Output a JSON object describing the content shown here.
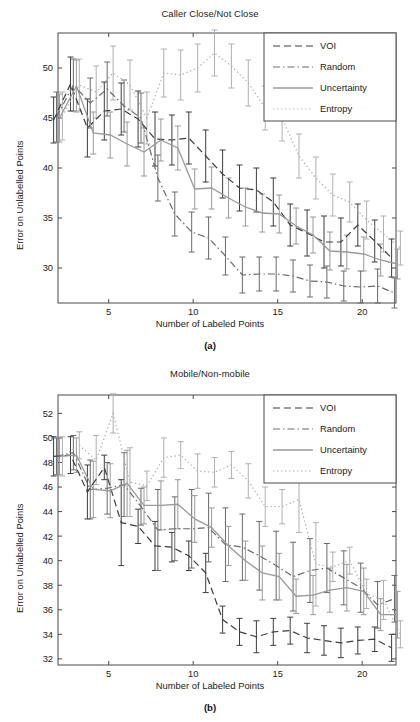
{
  "figure": {
    "axis_xlabel": "Number of Labeled Points",
    "axis_ylabel": "Error on Unlabelled Points",
    "panel_a_label": "(a)",
    "panel_b_label": "(b)"
  },
  "legend": {
    "entries": [
      {
        "label": "VOI",
        "style": "dashed",
        "color": "#3d3d3d"
      },
      {
        "label": "Random",
        "style": "dashdot",
        "color": "#6a6a6a"
      },
      {
        "label": "Uncertainty",
        "style": "solid",
        "color": "#9a9a9a"
      },
      {
        "label": "Entropy",
        "style": "dotted",
        "color": "#b0b0b0"
      }
    ]
  },
  "chart_data": [
    {
      "type": "line",
      "title": "Caller Close/Not Close",
      "xlabel": "Number of Labeled Points",
      "ylabel": "Error on Unlabelled Points",
      "panel": "(a)",
      "grid": false,
      "legend_position": "top-right",
      "xlim": [
        2,
        22
      ],
      "ylim": [
        26.5,
        53.5
      ],
      "xticks": [
        5,
        10,
        15,
        20
      ],
      "yticks": [
        30,
        35,
        40,
        45,
        50
      ],
      "x": [
        2,
        3,
        4,
        5,
        6,
        7,
        8,
        9,
        10,
        11,
        12,
        13,
        14,
        15,
        16,
        17,
        18,
        19,
        20,
        21,
        22
      ],
      "series": [
        {
          "name": "VOI",
          "style": "dashed",
          "color": "#3d3d3d",
          "values": [
            44.8,
            48.4,
            44.0,
            45.7,
            45.9,
            44.9,
            42.9,
            42.8,
            43.0,
            41.2,
            39.4,
            38.0,
            37.8,
            36.6,
            34.3,
            33.5,
            32.6,
            32.6,
            34.3,
            32.7,
            31.0
          ],
          "err": [
            2.3,
            2.7,
            2.9,
            2.9,
            2.6,
            2.8,
            2.7,
            2.5,
            2.6,
            2.6,
            2.4,
            2.3,
            2.2,
            2.4,
            2.1,
            2.3,
            2.6,
            2.4,
            2.1,
            2.1,
            1.9
          ]
        },
        {
          "name": "Random",
          "style": "dashdot",
          "color": "#6a6a6a",
          "values": [
            45.1,
            48.3,
            46.5,
            47.9,
            46.2,
            45.0,
            39.0,
            35.4,
            33.6,
            33.0,
            31.2,
            29.3,
            29.4,
            29.4,
            29.2,
            28.7,
            28.6,
            28.2,
            28.1,
            28.2,
            27.5
          ],
          "err": [
            2.5,
            2.6,
            2.5,
            2.7,
            2.6,
            2.5,
            2.3,
            2.2,
            2.0,
            2.1,
            1.9,
            1.8,
            1.7,
            1.7,
            1.6,
            1.6,
            1.6,
            1.5,
            1.6,
            1.7,
            1.5
          ]
        },
        {
          "name": "Uncertainty",
          "style": "solid",
          "color": "#9a9a9a",
          "values": [
            45.0,
            48.2,
            43.5,
            43.3,
            42.4,
            41.6,
            42.8,
            42.0,
            37.9,
            38.0,
            37.0,
            36.1,
            35.5,
            35.4,
            34.2,
            33.3,
            31.7,
            31.6,
            31.4,
            30.8,
            30.4
          ],
          "err": [
            2.4,
            2.6,
            2.1,
            2.3,
            2.2,
            2.4,
            2.1,
            2.2,
            2.0,
            2.1,
            2.0,
            1.9,
            1.9,
            1.9,
            1.8,
            1.8,
            1.9,
            1.7,
            1.7,
            1.6,
            1.5
          ]
        },
        {
          "name": "Entropy",
          "style": "dotted",
          "color": "#b0b0b0",
          "values": [
            45.2,
            48.3,
            47.6,
            49.5,
            48.3,
            45.0,
            49.5,
            49.3,
            50.0,
            51.5,
            50.2,
            48.5,
            46.0,
            45.0,
            41.2,
            39.0,
            37.3,
            36.6,
            34.8,
            33.4,
            32.0
          ],
          "err": [
            2.4,
            2.6,
            2.6,
            2.7,
            2.5,
            2.6,
            2.4,
            2.5,
            2.4,
            2.3,
            2.2,
            2.3,
            2.2,
            2.3,
            2.2,
            2.1,
            2.1,
            2.0,
            1.9,
            1.8,
            1.7
          ]
        }
      ]
    },
    {
      "type": "line",
      "title": "Mobile/Non-mobile",
      "xlabel": "Number of Labeled Points",
      "ylabel": "Error on Unlabelled Points",
      "panel": "(b)",
      "grid": false,
      "legend_position": "top-right",
      "xlim": [
        2,
        22
      ],
      "ylim": [
        31.5,
        53.5
      ],
      "xticks": [
        5,
        10,
        15,
        20
      ],
      "yticks": [
        32,
        34,
        36,
        38,
        40,
        42,
        44,
        46,
        48,
        50,
        52
      ],
      "x": [
        2,
        3,
        4,
        5,
        6,
        7,
        8,
        9,
        10,
        11,
        12,
        13,
        14,
        15,
        16,
        17,
        18,
        19,
        20,
        21,
        22
      ],
      "series": [
        {
          "name": "VOI",
          "style": "dashed",
          "color": "#3d3d3d",
          "values": [
            48.5,
            48.6,
            45.6,
            47.6,
            43.1,
            42.8,
            41.2,
            41.1,
            40.4,
            39.0,
            35.2,
            34.2,
            33.8,
            34.2,
            34.3,
            33.7,
            33.5,
            33.3,
            33.5,
            33.6,
            32.9
          ],
          "err": [
            1.6,
            1.5,
            2.2,
            1.0,
            3.5,
            1.4,
            2.0,
            1.2,
            1.2,
            1.6,
            1.1,
            1.1,
            1.3,
            1.1,
            1.1,
            1.2,
            1.2,
            1.2,
            1.1,
            1.0,
            1.1
          ]
        },
        {
          "name": "Random",
          "style": "dashdot",
          "color": "#6a6a6a",
          "values": [
            48.5,
            48.8,
            45.8,
            45.9,
            46.2,
            44.4,
            42.5,
            42.6,
            42.6,
            42.7,
            41.3,
            41.1,
            40.4,
            39.6,
            38.7,
            39.2,
            39.4,
            38.6,
            37.8,
            36.4,
            36.9
          ],
          "err": [
            1.5,
            1.4,
            2.4,
            2.1,
            2.6,
            1.5,
            3.3,
            2.6,
            3.2,
            2.8,
            3.0,
            2.7,
            2.8,
            2.8,
            2.8,
            2.6,
            2.0,
            2.2,
            2.0,
            1.9,
            1.9
          ]
        },
        {
          "name": "Uncertainty",
          "style": "solid",
          "color": "#9a9a9a",
          "values": [
            48.5,
            48.6,
            45.8,
            45.7,
            46.3,
            44.5,
            44.5,
            44.6,
            43.4,
            42.7,
            41.2,
            40.0,
            39.0,
            38.7,
            37.1,
            37.2,
            37.6,
            37.8,
            37.5,
            35.6,
            35.6
          ],
          "err": [
            1.5,
            1.4,
            2.3,
            2.2,
            2.7,
            1.5,
            2.0,
            2.0,
            1.9,
            1.6,
            1.6,
            1.6,
            2.2,
            1.9,
            1.4,
            1.6,
            1.8,
            1.9,
            1.9,
            1.3,
            1.9
          ]
        },
        {
          "name": "Entropy",
          "style": "dotted",
          "color": "#b0b0b0",
          "values": [
            48.5,
            49.4,
            48.2,
            52.0,
            46.4,
            46.1,
            48.4,
            48.6,
            47.3,
            47.2,
            47.8,
            46.5,
            44.4,
            44.4,
            45.0,
            39.7,
            39.5,
            40.0,
            37.3,
            36.8,
            34.0
          ],
          "err": [
            1.6,
            1.1,
            2.0,
            1.6,
            2.8,
            1.2,
            1.6,
            1.1,
            1.4,
            1.2,
            1.1,
            1.4,
            1.6,
            1.4,
            2.7,
            3.4,
            1.2,
            1.1,
            1.2,
            1.6,
            1.1
          ]
        }
      ]
    }
  ]
}
